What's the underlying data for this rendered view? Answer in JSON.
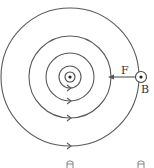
{
  "diagram": {
    "center_wire": {
      "symbol": "dot-out-of-page"
    },
    "field_lines": [
      {
        "radius": 11
      },
      {
        "radius": 24
      },
      {
        "radius": 41
      },
      {
        "radius": 69
      }
    ],
    "labels": {
      "force": "F",
      "wire_b": "B"
    },
    "colors": {
      "line": "#555555",
      "background": "#ffffff"
    }
  }
}
